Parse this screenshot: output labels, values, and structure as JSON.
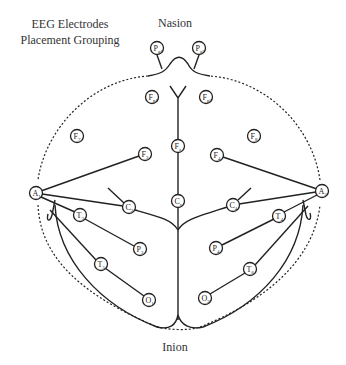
{
  "title_lines": [
    "EEG Electrodes",
    "Placement Grouping"
  ],
  "landmarks": {
    "nasion": "Nasion",
    "inion": "Inion"
  },
  "electrodes": [
    {
      "id": "Pg1",
      "main": "P",
      "sub": "g1",
      "x": 157,
      "y": 48
    },
    {
      "id": "Pg2",
      "main": "P",
      "sub": "g2",
      "x": 199,
      "y": 48
    },
    {
      "id": "Fp1",
      "main": "F",
      "sub": "p1",
      "x": 152,
      "y": 97
    },
    {
      "id": "Fp2",
      "main": "F",
      "sub": "p2",
      "x": 206,
      "y": 97
    },
    {
      "id": "F7",
      "main": "F",
      "sub": "7",
      "x": 77,
      "y": 136
    },
    {
      "id": "F8",
      "main": "F",
      "sub": "8",
      "x": 254,
      "y": 136
    },
    {
      "id": "F3",
      "main": "F",
      "sub": "3",
      "x": 145,
      "y": 154
    },
    {
      "id": "F4",
      "main": "F",
      "sub": "4",
      "x": 217,
      "y": 155
    },
    {
      "id": "Fz",
      "main": "F",
      "sub": "z",
      "x": 178,
      "y": 146
    },
    {
      "id": "A1",
      "main": "A",
      "sub": "1",
      "x": 36,
      "y": 193
    },
    {
      "id": "A2",
      "main": "A",
      "sub": "2",
      "x": 322,
      "y": 191
    },
    {
      "id": "C3",
      "main": "C",
      "sub": "3",
      "x": 129,
      "y": 207
    },
    {
      "id": "Cz",
      "main": "C",
      "sub": "z",
      "x": 178,
      "y": 201
    },
    {
      "id": "C4",
      "main": "C",
      "sub": "4",
      "x": 233,
      "y": 205
    },
    {
      "id": "T3",
      "main": "T",
      "sub": "3",
      "x": 80,
      "y": 215
    },
    {
      "id": "T4",
      "main": "T",
      "sub": "4",
      "x": 279,
      "y": 216
    },
    {
      "id": "P3",
      "main": "P",
      "sub": "3",
      "x": 140,
      "y": 249
    },
    {
      "id": "P4",
      "main": "P",
      "sub": "4",
      "x": 216,
      "y": 248
    },
    {
      "id": "T5",
      "main": "T",
      "sub": "5",
      "x": 101,
      "y": 264
    },
    {
      "id": "T6",
      "main": "T",
      "sub": "6",
      "x": 250,
      "y": 269
    },
    {
      "id": "O1",
      "main": "O",
      "sub": "1",
      "x": 149,
      "y": 300
    },
    {
      "id": "O2",
      "main": "O",
      "sub": "2",
      "x": 205,
      "y": 298
    }
  ]
}
